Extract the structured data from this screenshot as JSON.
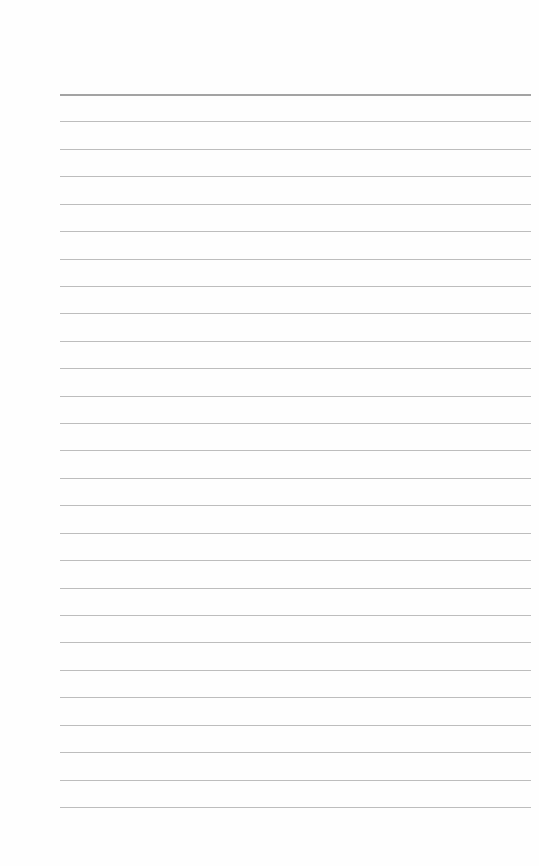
{
  "page": {
    "type": "lined-paper",
    "background_color": "#fefefe",
    "line_color": "#bdbdbd",
    "header_line_color": "#a3a3a3",
    "line_count": 27,
    "first_line_y": 94,
    "line_spacing": 27.42,
    "line_left": 60,
    "line_width": 471
  }
}
